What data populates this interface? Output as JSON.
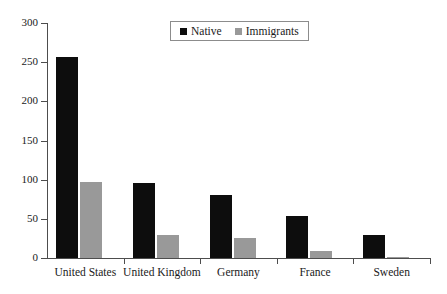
{
  "chart_data": {
    "type": "bar",
    "title": "",
    "xlabel": "",
    "ylabel": "",
    "categories": [
      "United States",
      "United Kingdom",
      "Germany",
      "France",
      "Sweden"
    ],
    "series": [
      {
        "name": "Native",
        "color": "#0d0d0d",
        "values": [
          257,
          96,
          81,
          53,
          30
        ]
      },
      {
        "name": "Immigrants",
        "color": "#999999",
        "values": [
          97,
          30,
          25,
          9,
          1
        ]
      }
    ],
    "ylim": [
      0,
      300
    ],
    "yticks": [
      0,
      50,
      100,
      150,
      200,
      250,
      300
    ],
    "ytick_labels": [
      "0",
      "50",
      "100",
      "150",
      "200",
      "250",
      "300"
    ],
    "grid": false,
    "legend_position": "top-center"
  },
  "legend": {
    "entries": [
      {
        "label": "Native",
        "swatch": "native-swatch"
      },
      {
        "label": "Immigrants",
        "swatch": "immigrants-swatch"
      }
    ]
  }
}
